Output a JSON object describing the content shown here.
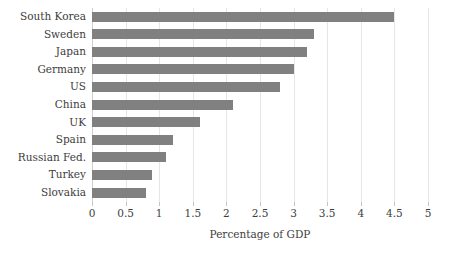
{
  "chart_data": {
    "type": "bar",
    "orientation": "horizontal",
    "title": "",
    "xlabel": "Percentage of GDP",
    "ylabel": "",
    "xlim": [
      0,
      5
    ],
    "ylim": null,
    "grid": true,
    "legend": null,
    "bar_color": "#808080",
    "grid_color": "#e6e6e6",
    "text_color": "#3d3d3d",
    "xticks": [
      0,
      0.5,
      1,
      1.5,
      2,
      2.5,
      3,
      3.5,
      4,
      4.5,
      5
    ],
    "xtick_labels": [
      "0",
      "0.5",
      "1",
      "1.5",
      "2",
      "2.5",
      "3",
      "3.5",
      "4",
      "4.5",
      "5"
    ],
    "categories": [
      "South Korea",
      "Sweden",
      "Japan",
      "Germany",
      "US",
      "China",
      "UK",
      "Spain",
      "Russian Fed.",
      "Turkey",
      "Slovakia"
    ],
    "values": [
      4.5,
      3.3,
      3.2,
      3.0,
      2.8,
      2.1,
      1.6,
      1.2,
      1.1,
      0.9,
      0.8
    ]
  }
}
